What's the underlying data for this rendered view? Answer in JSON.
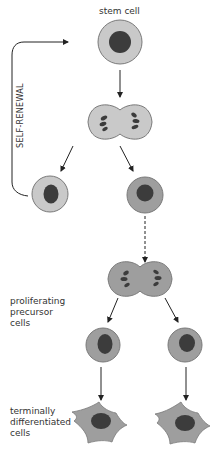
{
  "labels": {
    "stem_cell": "stem cell",
    "self_renewal": "SELF-RENEWAL",
    "proliferating_line1": "proliferating",
    "proliferating_line2": "precursor",
    "proliferating_line3": "cells",
    "terminal_line1": "terminally",
    "terminal_line2": "differentiated",
    "terminal_line3": "cells"
  },
  "colors": {
    "stem_cytoplasm": "#c9c9c9",
    "precursor_cytoplasm": "#9e9e9e",
    "nucleus": "#3c3c3c",
    "outline": "#7a7a7a",
    "arrow": "#222222"
  }
}
